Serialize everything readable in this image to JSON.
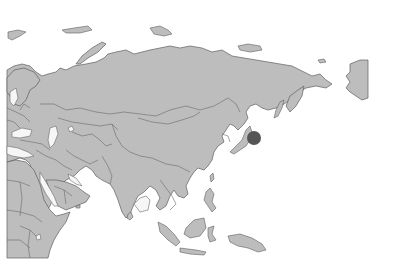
{
  "map": {
    "region": "Asia",
    "colors": {
      "background": "#ffffff",
      "land": "#bdbdbd",
      "border": "#5e5e5e",
      "marker": "#555555"
    },
    "markers": [
      {
        "name": "marker-east-of-japan",
        "cx": 254,
        "cy": 138,
        "r": 7,
        "color": "#555555"
      }
    ]
  }
}
